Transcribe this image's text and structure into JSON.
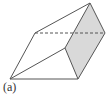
{
  "figure": {
    "label": "(a)",
    "colors": {
      "stroke": "#555555",
      "shade": "#d9d9d9",
      "background": "#ffffff"
    },
    "vertices": {
      "apex_top": [
        90,
        3
      ],
      "right": [
        105,
        33
      ],
      "back_left": [
        35,
        33
      ],
      "bottom_left": [
        10,
        79
      ],
      "bottom_right": [
        78,
        79
      ],
      "front_top": [
        65,
        48
      ]
    },
    "shaded_face": [
      "apex_top",
      "right",
      "bottom_right",
      "front_top"
    ],
    "solid_edges": [
      [
        "back_left",
        "apex_top"
      ],
      [
        "back_left",
        "bottom_left"
      ],
      [
        "bottom_left",
        "bottom_right"
      ],
      [
        "bottom_left",
        "front_top"
      ]
    ],
    "dashed_edges": [
      [
        "back_left",
        "right"
      ]
    ]
  }
}
